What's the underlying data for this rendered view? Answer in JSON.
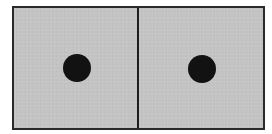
{
  "diagram": {
    "title": "",
    "colors": {
      "background": "#ffffff",
      "panel_fill": "#c4c4c4",
      "border": "#2a2a2a",
      "divider": "#1e1e1e",
      "dot": "#121212"
    },
    "panels": [
      {
        "id": "left",
        "label": "",
        "dot": {
          "center_x_px": 63,
          "center_y_px": 60,
          "diameter_px": 28
        }
      },
      {
        "id": "right",
        "label": "",
        "dot": {
          "center_x_px": 63,
          "center_y_px": 61,
          "diameter_px": 28
        }
      }
    ]
  }
}
